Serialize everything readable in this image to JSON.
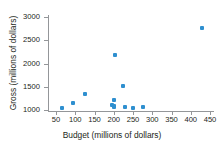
{
  "chart_data": {
    "type": "scatter",
    "title": "",
    "xlabel": "Budget (millions of dollars)",
    "ylabel": "Gross (millions of dollars)",
    "xlim": [
      50,
      450
    ],
    "ylim": [
      1000,
      3000
    ],
    "xticks": [
      50,
      100,
      150,
      200,
      250,
      300,
      350,
      400,
      450
    ],
    "yticks": [
      1000,
      1500,
      2000,
      2500,
      3000
    ],
    "xtick_labels": [
      "50",
      "100",
      "150",
      "200",
      "250",
      "300",
      "350",
      "400",
      "450"
    ],
    "ytick_labels": [
      "1000",
      "1500",
      "2000",
      "2500",
      "3000"
    ],
    "grid": false,
    "legend": null,
    "marker_color": "#2f8fcf",
    "axis_color": "#949699",
    "series": [
      {
        "name": "movies",
        "points": [
          {
            "x": 65,
            "y": 1045
          },
          {
            "x": 95,
            "y": 1150
          },
          {
            "x": 125,
            "y": 1335
          },
          {
            "x": 195,
            "y": 1100
          },
          {
            "x": 200,
            "y": 1215
          },
          {
            "x": 200,
            "y": 1090
          },
          {
            "x": 200,
            "y": 1060
          },
          {
            "x": 202,
            "y": 2190
          },
          {
            "x": 225,
            "y": 1520
          },
          {
            "x": 228,
            "y": 1065
          },
          {
            "x": 250,
            "y": 1035
          },
          {
            "x": 275,
            "y": 1075
          },
          {
            "x": 430,
            "y": 2760
          }
        ]
      }
    ]
  }
}
